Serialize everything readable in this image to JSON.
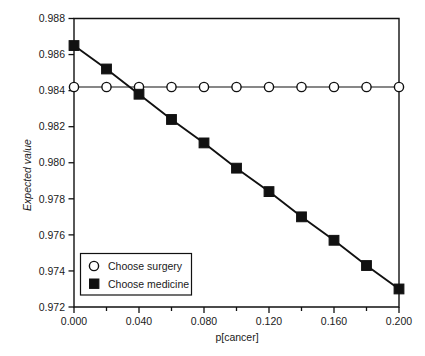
{
  "chart_data": {
    "type": "line",
    "title": "",
    "subtitle": "",
    "xlabel": "p[cancer]",
    "ylabel": "Expected value",
    "xlim": [
      0.0,
      0.2
    ],
    "ylim": [
      0.972,
      0.988
    ],
    "grid": false,
    "legend_position": "lower-left-inside",
    "x": [
      0.0,
      0.02,
      0.04,
      0.06,
      0.08,
      0.1,
      0.12,
      0.14,
      0.16,
      0.18,
      0.2
    ],
    "series": [
      {
        "name": "Choose surgery",
        "marker": "open-circle",
        "values": [
          0.9842,
          0.9842,
          0.9842,
          0.9842,
          0.9842,
          0.9842,
          0.9842,
          0.9842,
          0.9842,
          0.9842,
          0.9842
        ]
      },
      {
        "name": "Choose medicine",
        "marker": "filled-square",
        "values": [
          0.9865,
          0.9852,
          0.9838,
          0.9824,
          0.9811,
          0.9797,
          0.9784,
          0.977,
          0.9757,
          0.9743,
          0.973
        ]
      }
    ],
    "x_tick_values": [
      0.0,
      0.04,
      0.08,
      0.12,
      0.16,
      0.2
    ],
    "x_tick_labels": [
      "0.000",
      "0.040",
      "0.080",
      "0.120",
      "0.160",
      "0.200"
    ],
    "x_minor_tick_values": [
      0.02,
      0.06,
      0.1,
      0.14,
      0.18
    ],
    "y_tick_values": [
      0.972,
      0.974,
      0.976,
      0.978,
      0.98,
      0.982,
      0.984,
      0.986,
      0.988
    ],
    "y_tick_labels": [
      "0.972",
      "0.974",
      "0.976",
      "0.978",
      "0.980",
      "0.982",
      "0.984",
      "0.986",
      "0.988"
    ],
    "colors": {
      "line": "#111111",
      "marker_fill_surgery": "#ffffff",
      "marker_fill_medicine": "#111111",
      "background": "#ffffff",
      "text": "#1a1a1a"
    }
  },
  "legend": {
    "items": [
      {
        "label": "Choose surgery",
        "marker": "open-circle"
      },
      {
        "label": "Choose medicine",
        "marker": "filled-square"
      }
    ]
  }
}
